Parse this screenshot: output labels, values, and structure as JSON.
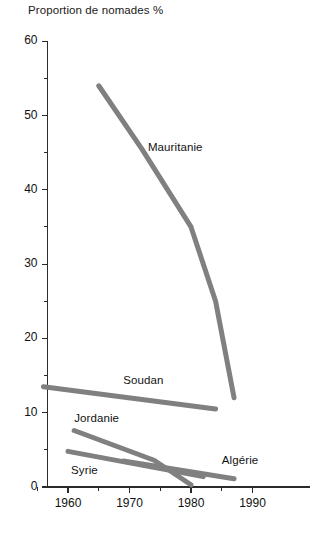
{
  "chart_data": {
    "type": "line",
    "title": "Proportion de nomades %",
    "xlabel": "",
    "ylabel": "",
    "xlim": [
      1955,
      1992
    ],
    "ylim": [
      0,
      60
    ],
    "grid": false,
    "legend_position": "inline-labels",
    "y_ticks_major": [
      0,
      10,
      20,
      30,
      40,
      50,
      60
    ],
    "y_ticks_minor": [
      5,
      15,
      25,
      35,
      45,
      55
    ],
    "x_ticks_major": [
      1960,
      1970,
      1980,
      1990
    ],
    "x_ticks_minor": [
      1955,
      1965,
      1975,
      1985
    ],
    "y_tick_labels": [
      "0",
      "10",
      "20",
      "30",
      "40",
      "50",
      "60"
    ],
    "x_tick_labels": [
      "1960",
      "1970",
      "1980",
      "1990"
    ],
    "line_color": "#808080",
    "line_width": 5,
    "series": [
      {
        "name": "Mauritanie",
        "label": "Mauritanie",
        "x": [
          1965,
          1972,
          1980,
          1984,
          1987
        ],
        "values": [
          54.0,
          45.5,
          35.0,
          25.0,
          12.0
        ],
        "label_x": 1973,
        "label_y": 45.5
      },
      {
        "name": "Soudan",
        "label": "Soudan",
        "x": [
          1956,
          1984
        ],
        "values": [
          13.5,
          10.5
        ],
        "label_x": 1969,
        "label_y": 14.2
      },
      {
        "name": "Jordanie",
        "label": "Jordanie",
        "x": [
          1961,
          1974,
          1980
        ],
        "values": [
          7.6,
          3.6,
          0.3
        ],
        "label_x": 1961,
        "label_y": 9.0
      },
      {
        "name": "Syrie",
        "label": "Syrie",
        "x": [
          1960,
          1982
        ],
        "values": [
          4.8,
          1.4
        ],
        "label_x": 1960.5,
        "label_y": 2.0
      },
      {
        "name": "Algérie",
        "label": "Algérie",
        "x": [
          1969,
          1987
        ],
        "values": [
          3.5,
          1.1
        ],
        "label_x": 1985,
        "label_y": 3.4
      }
    ]
  }
}
